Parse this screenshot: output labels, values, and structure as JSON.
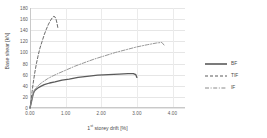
{
  "chart_data": {
    "type": "line",
    "title": "",
    "xlabel": "1st storey drift [%]",
    "xlabel_base": "1",
    "xlabel_sup": "st",
    "xlabel_rest": " storey drift [%]",
    "ylabel": "Base shear [kN]",
    "xlim": [
      0.0,
      4.35
    ],
    "ylim": [
      0,
      180
    ],
    "xticks": [
      "0.00",
      "1.00",
      "2.00",
      "3.00",
      "4.00"
    ],
    "xtick_values": [
      0.0,
      1.0,
      2.0,
      3.0,
      4.0
    ],
    "yticks": [
      "0",
      "20",
      "40",
      "60",
      "80",
      "100",
      "120",
      "140",
      "160",
      "180"
    ],
    "ytick_values": [
      0,
      20,
      40,
      60,
      80,
      100,
      120,
      140,
      160,
      180
    ],
    "grid": {
      "horizontal": true,
      "vertical": true
    },
    "legend_position": "right",
    "series": [
      {
        "name": "BF",
        "style": "solid",
        "color": "#5a5a5a",
        "points": [
          [
            0.0,
            0
          ],
          [
            0.03,
            8
          ],
          [
            0.06,
            17
          ],
          [
            0.09,
            25
          ],
          [
            0.12,
            30
          ],
          [
            0.16,
            33
          ],
          [
            0.22,
            36
          ],
          [
            0.3,
            39
          ],
          [
            0.4,
            42
          ],
          [
            0.55,
            45
          ],
          [
            0.7,
            47
          ],
          [
            0.9,
            50
          ],
          [
            1.1,
            52
          ],
          [
            1.35,
            55
          ],
          [
            1.6,
            57
          ],
          [
            1.9,
            59
          ],
          [
            2.2,
            60
          ],
          [
            2.5,
            61
          ],
          [
            2.75,
            62
          ],
          [
            2.9,
            62
          ],
          [
            2.97,
            60
          ],
          [
            3.0,
            55
          ]
        ]
      },
      {
        "name": "TIF",
        "style": "dashed",
        "color": "#5a5a5a",
        "points": [
          [
            0.0,
            0
          ],
          [
            0.03,
            14
          ],
          [
            0.06,
            30
          ],
          [
            0.09,
            45
          ],
          [
            0.13,
            62
          ],
          [
            0.18,
            80
          ],
          [
            0.23,
            95
          ],
          [
            0.28,
            108
          ],
          [
            0.34,
            120
          ],
          [
            0.4,
            132
          ],
          [
            0.46,
            142
          ],
          [
            0.52,
            151
          ],
          [
            0.58,
            158
          ],
          [
            0.63,
            163
          ],
          [
            0.67,
            165
          ],
          [
            0.7,
            164
          ],
          [
            0.73,
            160
          ],
          [
            0.76,
            152
          ],
          [
            0.78,
            145
          ]
        ]
      },
      {
        "name": "IF",
        "style": "dashdot",
        "color": "#8a8a8a",
        "points": [
          [
            0.0,
            0
          ],
          [
            0.04,
            12
          ],
          [
            0.08,
            24
          ],
          [
            0.12,
            32
          ],
          [
            0.18,
            37
          ],
          [
            0.26,
            42
          ],
          [
            0.36,
            47
          ],
          [
            0.5,
            53
          ],
          [
            0.65,
            58
          ],
          [
            0.82,
            63
          ],
          [
            1.0,
            68
          ],
          [
            1.25,
            75
          ],
          [
            1.5,
            81
          ],
          [
            1.8,
            88
          ],
          [
            2.1,
            94
          ],
          [
            2.4,
            100
          ],
          [
            2.7,
            105
          ],
          [
            3.0,
            110
          ],
          [
            3.3,
            114
          ],
          [
            3.55,
            117
          ],
          [
            3.7,
            118
          ],
          [
            3.78,
            112
          ]
        ]
      }
    ]
  },
  "legend": {
    "items": [
      {
        "label": "BF",
        "style": "solid"
      },
      {
        "label": "TIF",
        "style": "dashed"
      },
      {
        "label": "IF",
        "style": "dashdot"
      }
    ]
  }
}
